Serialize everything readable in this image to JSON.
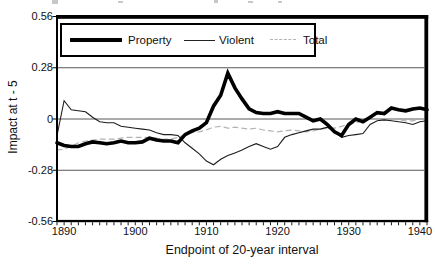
{
  "figure": {
    "y_axis_title": "Impact at t - 5",
    "x_axis_title": "Endpoint of 20-year interval"
  },
  "legend": {
    "entries": [
      {
        "label": "Property",
        "style": "thick-solid",
        "color": "#000000"
      },
      {
        "label": "Violent",
        "style": "thin-solid",
        "color": "#222222"
      },
      {
        "label": "Total",
        "style": "dashed",
        "color": "#b3b3b3"
      }
    ],
    "position": "top-left-inside"
  },
  "colors": {
    "frame": "#000000",
    "gridline": "#444444",
    "background": "#ffffff",
    "property_line": "#000000",
    "violent_line": "#1c1c1c",
    "total_line": "#b3b3b3"
  },
  "chart_data": {
    "type": "line",
    "title": "",
    "xlabel": "Endpoint of 20-year interval",
    "ylabel": "Impact at t - 5",
    "xlim": [
      1889,
      1941
    ],
    "ylim": [
      -0.56,
      0.56
    ],
    "y_ticks": [
      0.56,
      0.28,
      0,
      -0.28,
      -0.56
    ],
    "y_tick_labels": [
      "0.56",
      "0.28",
      "0",
      "-0.28",
      "-0.56"
    ],
    "x_ticks": [
      1890,
      1900,
      1910,
      1920,
      1930,
      1940
    ],
    "x_tick_labels": [
      "1890",
      "1900",
      "1910",
      "1920",
      "1930",
      "1940"
    ],
    "minor_x_tick_step": 1,
    "gridlines": [
      0.28,
      0,
      -0.28
    ],
    "grid": true,
    "legend_position": "top-left-inside",
    "x": [
      1889,
      1890,
      1891,
      1892,
      1893,
      1894,
      1895,
      1896,
      1897,
      1898,
      1899,
      1900,
      1901,
      1902,
      1903,
      1904,
      1905,
      1906,
      1907,
      1908,
      1909,
      1910,
      1911,
      1912,
      1913,
      1914,
      1915,
      1916,
      1917,
      1918,
      1919,
      1920,
      1921,
      1922,
      1923,
      1924,
      1925,
      1926,
      1927,
      1928,
      1929,
      1930,
      1931,
      1932,
      1933,
      1934,
      1935,
      1936,
      1937,
      1938,
      1939,
      1940,
      1941
    ],
    "series": [
      {
        "name": "Property",
        "style": "thick-solid",
        "color": "#000000",
        "values": [
          -0.13,
          -0.145,
          -0.15,
          -0.15,
          -0.135,
          -0.125,
          -0.13,
          -0.135,
          -0.13,
          -0.12,
          -0.13,
          -0.13,
          -0.125,
          -0.105,
          -0.115,
          -0.12,
          -0.12,
          -0.13,
          -0.085,
          -0.065,
          -0.05,
          -0.02,
          0.07,
          0.13,
          0.25,
          0.17,
          0.11,
          0.055,
          0.035,
          0.03,
          0.03,
          0.04,
          0.03,
          0.03,
          0.03,
          0.01,
          -0.01,
          0.0,
          -0.03,
          -0.07,
          -0.09,
          -0.03,
          0.0,
          -0.015,
          0.01,
          0.035,
          0.03,
          0.06,
          0.05,
          0.045,
          0.055,
          0.06,
          0.05
        ]
      },
      {
        "name": "Violent",
        "style": "thin-solid",
        "color": "#1c1c1c",
        "values": [
          -0.09,
          0.1,
          0.05,
          0.045,
          0.04,
          0.01,
          -0.015,
          -0.02,
          -0.02,
          -0.04,
          -0.045,
          -0.05,
          -0.055,
          -0.06,
          -0.075,
          -0.085,
          -0.085,
          -0.09,
          -0.13,
          -0.16,
          -0.19,
          -0.23,
          -0.25,
          -0.22,
          -0.2,
          -0.185,
          -0.17,
          -0.15,
          -0.135,
          -0.15,
          -0.165,
          -0.15,
          -0.1,
          -0.085,
          -0.075,
          -0.065,
          -0.055,
          -0.055,
          -0.045,
          -0.07,
          -0.1,
          -0.09,
          -0.085,
          -0.08,
          -0.03,
          -0.01,
          -0.005,
          -0.01,
          -0.015,
          -0.02,
          -0.03,
          -0.015,
          -0.01
        ]
      },
      {
        "name": "Total",
        "style": "dashed",
        "color": "#b3b3b3",
        "values": [
          -0.17,
          -0.165,
          -0.15,
          -0.13,
          -0.12,
          -0.115,
          -0.11,
          -0.11,
          -0.11,
          -0.105,
          -0.1,
          -0.1,
          -0.1,
          -0.1,
          -0.105,
          -0.11,
          -0.11,
          -0.1,
          -0.085,
          -0.075,
          -0.07,
          -0.06,
          -0.045,
          -0.04,
          -0.05,
          -0.045,
          -0.05,
          -0.055,
          -0.05,
          -0.06,
          -0.065,
          -0.07,
          -0.065,
          -0.06,
          -0.065,
          -0.07,
          -0.065,
          -0.055,
          -0.05,
          -0.05,
          -0.04,
          -0.03,
          -0.02,
          -0.01,
          0.0,
          0.0,
          -0.005,
          0.0,
          -0.005,
          -0.01,
          -0.01,
          0.0,
          -0.005
        ]
      }
    ]
  }
}
